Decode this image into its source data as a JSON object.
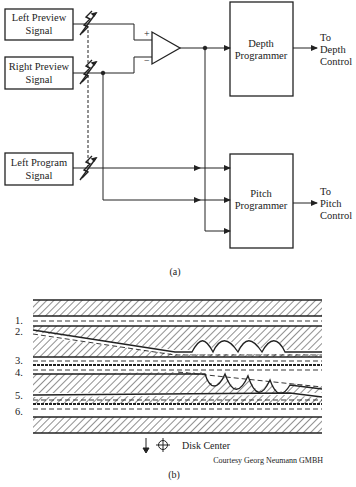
{
  "figure_a": {
    "caption": "(a)",
    "inputs": {
      "left_preview": [
        "Left Preview",
        "Signal"
      ],
      "right_preview": [
        "Right Preview",
        "Signal"
      ],
      "left_program": [
        "Left Program",
        "Signal"
      ]
    },
    "amplifier": {
      "plus": "+",
      "minus": "−"
    },
    "depth_programmer": [
      "Depth",
      "Programmer"
    ],
    "pitch_programmer": [
      "Pitch",
      "Programmer"
    ],
    "depth_output": [
      "To",
      "Depth",
      "Control"
    ],
    "pitch_output": [
      "To",
      "Pitch",
      "Control"
    ]
  },
  "figure_b": {
    "caption": "(b)",
    "groove_labels": [
      "1.",
      "2.",
      "3.",
      "4.",
      "5.",
      "6."
    ],
    "disk_center": "Disk Center",
    "credit": "Courtesy Georg Neumann GMBH"
  }
}
